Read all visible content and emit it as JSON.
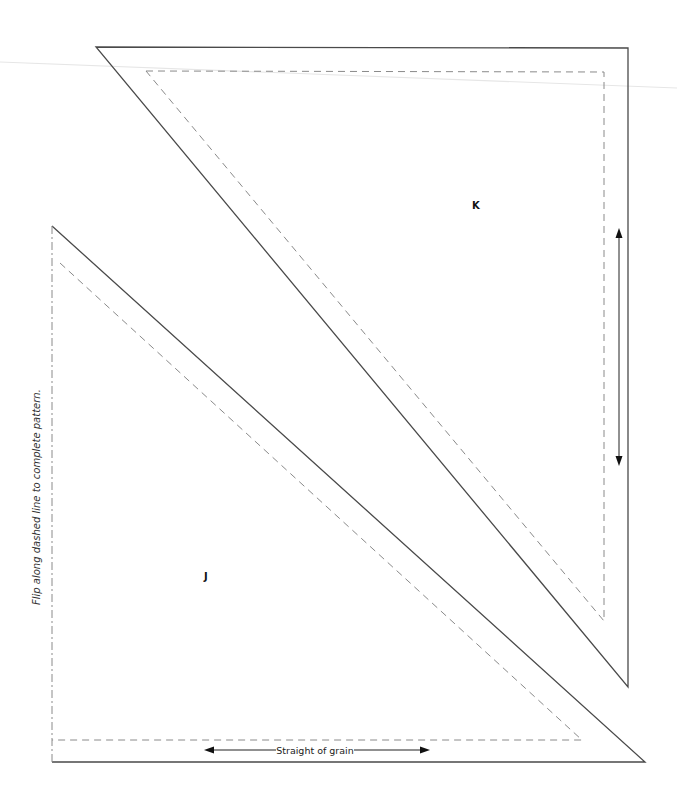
{
  "pattern": {
    "pieces": [
      {
        "id": "K",
        "label": "K",
        "shape": "right-triangle",
        "orientation": "right-angle top-right",
        "grain_arrow": "vertical",
        "grain_label": ""
      },
      {
        "id": "J",
        "label": "J",
        "shape": "right-triangle",
        "orientation": "right-angle bottom-left",
        "grain_arrow": "horizontal",
        "grain_label": "Straight of grain"
      }
    ],
    "fold_instruction": "Flip along dashed line to complete pattern.",
    "colors": {
      "cut_line": "#4a4a4a",
      "sew_line": "#8a8a8a",
      "text": "#111111",
      "background": "#ffffff"
    }
  }
}
